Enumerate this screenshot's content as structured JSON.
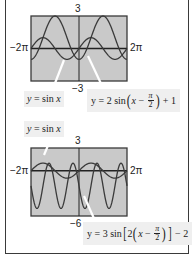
{
  "chart_data": [
    {
      "type": "line",
      "title": "",
      "xlabel": "",
      "ylabel": "",
      "xlim_label": [
        "−2π",
        "2π"
      ],
      "ylim_label": [
        "−3",
        "3"
      ],
      "xlim": [
        -6.283,
        6.283
      ],
      "ylim": [
        -3,
        3
      ],
      "grid": false,
      "series": [
        {
          "name": "y = sin x",
          "expr": "sin(x)",
          "amplitude": 1,
          "b": 1,
          "shift": 0,
          "vshift": 0
        },
        {
          "name": "y = 2 sin(x − π/2) + 1",
          "expr": "2*sin(x - pi/2) + 1",
          "amplitude": 2,
          "b": 1,
          "shift": 1.5708,
          "vshift": 1
        }
      ]
    },
    {
      "type": "line",
      "title": "",
      "xlabel": "",
      "ylabel": "",
      "xlim_label": [
        "−2π",
        "2π"
      ],
      "ylim_label": [
        "−6",
        "3"
      ],
      "xlim": [
        -6.283,
        6.283
      ],
      "ylim": [
        -6,
        3
      ],
      "grid": false,
      "series": [
        {
          "name": "y = sin x",
          "expr": "sin(x)",
          "amplitude": 1,
          "b": 1,
          "shift": 0,
          "vshift": 0
        },
        {
          "name": "y = 3 sin[2(x − π/2)] − 2",
          "expr": "3*sin(2*(x - pi/2)) - 2",
          "amplitude": 3,
          "b": 2,
          "shift": 1.5708,
          "vshift": -2
        }
      ]
    }
  ],
  "graph1": {
    "ymax": "3",
    "ymin": "−3",
    "xmin": "−2π",
    "xmax": "2π",
    "label_sin": {
      "y": "y",
      "eq": " = sin ",
      "x": "x"
    },
    "label_trans": {
      "pre": "y = 2 sin",
      "x": "x",
      "minus": " − ",
      "num": "π",
      "den": "2",
      "post": " + 1"
    }
  },
  "graph2": {
    "ymax": "3",
    "ymin": "−6",
    "xmin": "−2π",
    "xmax": "2π",
    "label_sin": {
      "y": "y",
      "eq": " = sin ",
      "x": "x"
    },
    "label_trans": {
      "pre": "y = 3 sin",
      "two": "2",
      "x": "x",
      "minus": " − ",
      "num": "π",
      "den": "2",
      "post": " − 2"
    }
  },
  "colors": {
    "plot_bg": "#c9c9c9",
    "curve": "#3a3a3a",
    "axis": "#222222",
    "label_bg": "#efefef",
    "pointer": "#ffffff"
  }
}
